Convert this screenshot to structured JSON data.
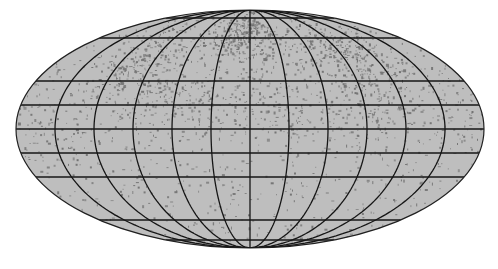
{
  "map": {
    "projection": "mollweide",
    "center": [
      250,
      129
    ],
    "rx": 234,
    "ry": 119,
    "colors": {
      "background": "#ffffff",
      "fill": "#bebebe",
      "grid": "#161616",
      "outline": "#202020",
      "points": "#737373"
    },
    "meridian_step_deg": 30,
    "parallels_px_offset": [
      -111,
      -91,
      -48,
      -24,
      0,
      24,
      48,
      91,
      111
    ],
    "clusters": [
      {
        "lon": 105,
        "lat": 38,
        "spread_lon": 22,
        "spread_lat": 18,
        "count": 260
      },
      {
        "lon": 80,
        "lat": 55,
        "spread_lon": 18,
        "spread_lat": 12,
        "count": 90
      },
      {
        "lon": 5,
        "lat": 60,
        "spread_lon": 25,
        "spread_lat": 12,
        "count": 220
      },
      {
        "lon": -25,
        "lat": 62,
        "spread_lon": 18,
        "spread_lat": 10,
        "count": 120
      },
      {
        "lon": -110,
        "lat": 45,
        "spread_lon": 15,
        "spread_lat": 15,
        "count": 160
      },
      {
        "lon": -85,
        "lat": 30,
        "spread_lon": 18,
        "spread_lat": 12,
        "count": 80
      },
      {
        "lon": 0,
        "lat": 20,
        "spread_lon": 30,
        "spread_lat": 12,
        "count": 110
      },
      {
        "lon": -60,
        "lat": 15,
        "spread_lon": 25,
        "spread_lat": 10,
        "count": 80
      },
      {
        "lon": 60,
        "lat": 10,
        "spread_lon": 30,
        "spread_lat": 10,
        "count": 80
      },
      {
        "lon": 150,
        "lat": 10,
        "spread_lon": 25,
        "spread_lat": 12,
        "count": 60
      },
      {
        "lon": -150,
        "lat": 5,
        "spread_lon": 25,
        "spread_lat": 12,
        "count": 60
      }
    ],
    "background_points": 900
  }
}
